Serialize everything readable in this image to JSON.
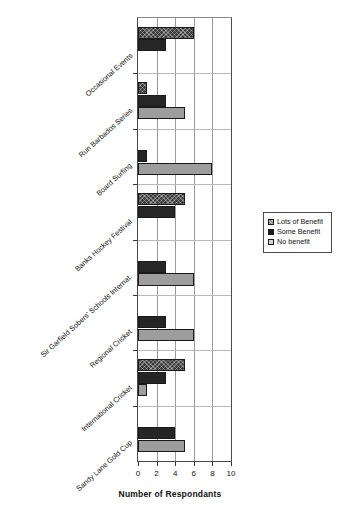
{
  "chart_data": {
    "type": "bar",
    "orientation": "horizontal",
    "title": "",
    "xlabel": "Number of Respondants",
    "ylabel": "",
    "xlim": [
      0,
      10
    ],
    "xticks": [
      0,
      2,
      4,
      6,
      8,
      10
    ],
    "xtick_labels": [
      "0",
      "2",
      "4",
      "6",
      "8",
      "10"
    ],
    "grid": true,
    "grid_axis": "x",
    "legend_position": "right",
    "categories": [
      "Occasional Events",
      "Run Barbados Series",
      "Board Surfing",
      "Banks Hockey Festival",
      "Sir Garfield Sobers' Schools Internat.",
      "Regional Cricket",
      "International Cricket",
      "Sandy Lane Gold Cup"
    ],
    "series": [
      {
        "name": "Lots of Benefit",
        "fill": "crosshatch-dark",
        "color": "#3a3a3a",
        "values": [
          6,
          1,
          0,
          5,
          0,
          0,
          5,
          0
        ]
      },
      {
        "name": "Some Benefit",
        "fill": "solid-black",
        "color": "#262626",
        "values": [
          3,
          3,
          1,
          4,
          3,
          3,
          3,
          4
        ]
      },
      {
        "name": "No benefit",
        "fill": "solid-gray",
        "color": "#9d9d9d",
        "values": [
          0,
          5,
          8,
          0,
          6,
          6,
          1,
          5
        ]
      }
    ]
  },
  "legend": {
    "items": [
      {
        "label": "Lots of Benefit",
        "swatch": "s-lots"
      },
      {
        "label": "Some Benefit",
        "swatch": "s-some"
      },
      {
        "label": "No benefit",
        "swatch": "s-no"
      }
    ]
  },
  "axis": {
    "x_title": "Number of Respondants"
  }
}
